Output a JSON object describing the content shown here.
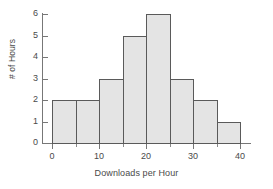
{
  "chart_data": {
    "type": "bar",
    "title": "",
    "subtitle": "",
    "xlabel": "Downloads per Hour",
    "ylabel": "# of Hours",
    "bin_width": 5,
    "bin_edges": [
      0,
      5,
      10,
      15,
      20,
      25,
      30,
      35,
      40
    ],
    "categories": [
      "0-5",
      "5-10",
      "10-15",
      "15-20",
      "20-25",
      "25-30",
      "30-35",
      "35-40"
    ],
    "values": [
      2,
      2,
      3,
      5,
      6,
      3,
      2,
      1
    ],
    "xlim": [
      0,
      40
    ],
    "ylim": [
      0,
      6
    ],
    "x_ticks": [
      0,
      10,
      20,
      30,
      40
    ],
    "x_tick_labels": [
      "0",
      "10",
      "20",
      "30",
      "40"
    ],
    "x_minor_ticks": [
      5,
      15,
      25,
      35
    ],
    "y_ticks": [
      0,
      1,
      2,
      3,
      4,
      5,
      6
    ],
    "y_tick_labels": [
      "0",
      "1",
      "2",
      "3",
      "4",
      "5",
      "6"
    ],
    "grid": false,
    "legend": false,
    "legend_position": "none",
    "bar_fill_color": "#e4e4e4",
    "bar_edge_color": "#5a5a5a",
    "axis_color": "#777777",
    "text_color": "#4a4a4a",
    "background_color": "#ffffff"
  }
}
